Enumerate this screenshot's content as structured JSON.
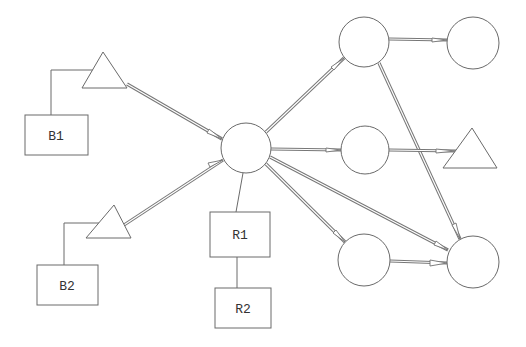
{
  "diagram": {
    "type": "network-topology",
    "nodes": [
      {
        "id": "hub",
        "shape": "circle",
        "cx": 246,
        "cy": 148,
        "r": 25,
        "label": ""
      },
      {
        "id": "c-top",
        "shape": "circle",
        "cx": 364,
        "cy": 42,
        "r": 25,
        "label": ""
      },
      {
        "id": "c-top-right",
        "shape": "circle",
        "cx": 473,
        "cy": 43,
        "r": 26,
        "label": ""
      },
      {
        "id": "c-mid",
        "shape": "circle",
        "cx": 365,
        "cy": 150,
        "r": 24,
        "label": ""
      },
      {
        "id": "c-bottom",
        "shape": "circle",
        "cx": 364,
        "cy": 260,
        "r": 26,
        "label": ""
      },
      {
        "id": "c-bottom-right",
        "shape": "circle",
        "cx": 473,
        "cy": 262,
        "r": 26,
        "label": ""
      },
      {
        "id": "t-mid-right",
        "shape": "triangle",
        "points": "472,128 443,168 497,168",
        "label": ""
      },
      {
        "id": "t-1",
        "shape": "triangle",
        "points": "103,52 82,88 127,88",
        "label": ""
      },
      {
        "id": "t-2",
        "shape": "triangle",
        "points": "114,205 86,238 131,238",
        "label": ""
      },
      {
        "id": "B1",
        "shape": "rect",
        "x": 25,
        "y": 115,
        "w": 63,
        "h": 40,
        "label": "B1"
      },
      {
        "id": "B2",
        "shape": "rect",
        "x": 37,
        "y": 265,
        "w": 61,
        "h": 40,
        "label": "B2"
      },
      {
        "id": "R1",
        "shape": "rect",
        "x": 210,
        "y": 212,
        "w": 60,
        "h": 45,
        "label": "R1"
      },
      {
        "id": "R2",
        "shape": "rect",
        "x": 215,
        "y": 288,
        "w": 56,
        "h": 40,
        "label": "R2"
      }
    ],
    "labels": {
      "B1": "B1",
      "B2": "B2",
      "R1": "R1",
      "R2": "R2"
    },
    "edges": [
      {
        "from": "t-1",
        "to": "hub",
        "kind": "arrow"
      },
      {
        "from": "t-2",
        "to": "hub",
        "kind": "arrow"
      },
      {
        "from": "hub",
        "to": "c-top",
        "kind": "arrow"
      },
      {
        "from": "hub",
        "to": "c-mid",
        "kind": "arrow"
      },
      {
        "from": "hub",
        "to": "c-bottom",
        "kind": "arrow"
      },
      {
        "from": "hub",
        "to": "c-bottom-right",
        "kind": "arrow"
      },
      {
        "from": "c-top",
        "to": "c-top-right",
        "kind": "arrow"
      },
      {
        "from": "c-top",
        "to": "c-bottom-right",
        "kind": "arrow"
      },
      {
        "from": "c-mid",
        "to": "t-mid-right",
        "kind": "arrow"
      },
      {
        "from": "c-bottom",
        "to": "c-bottom-right",
        "kind": "arrow"
      },
      {
        "from": "B1",
        "to": "t-1",
        "kind": "line"
      },
      {
        "from": "B2",
        "to": "t-2",
        "kind": "line"
      },
      {
        "from": "hub",
        "to": "R1",
        "kind": "line"
      },
      {
        "from": "R1",
        "to": "R2",
        "kind": "line"
      }
    ],
    "colors": {
      "stroke": "#6a6a6a",
      "background": "#ffffff",
      "text": "#333333"
    }
  }
}
